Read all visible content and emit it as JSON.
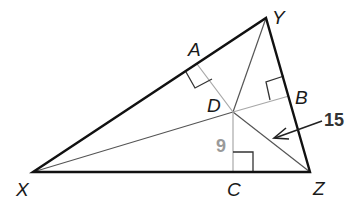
{
  "figure": {
    "type": "triangle with incenter-style perpendiculars and segments to vertices",
    "points": {
      "X": {
        "label": "X",
        "x": 33,
        "y": 172
      },
      "Y": {
        "label": "Y",
        "x": 266,
        "y": 18
      },
      "Z": {
        "label": "Z",
        "x": 310,
        "y": 172
      },
      "D": {
        "label": "D",
        "x": 233,
        "y": 112
      },
      "A": {
        "label": "A",
        "x": 197,
        "y": 64
      },
      "B": {
        "label": "B",
        "x": 291,
        "y": 97
      },
      "C": {
        "label": "C",
        "x": 233,
        "y": 172
      }
    },
    "measurements": {
      "DC": {
        "value": "9",
        "color": "#9a9a9a"
      },
      "DZ": {
        "value": "15",
        "color": "#333333"
      }
    },
    "colors": {
      "triangle": "#111111",
      "perpendiculars": "#a8a8a8",
      "vertex_segments": "#555555"
    }
  }
}
